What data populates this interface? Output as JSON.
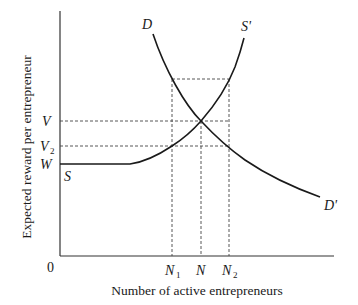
{
  "diagram": {
    "type": "supply-demand",
    "axes": {
      "x_label": "Number of active entrepreneurs",
      "y_label": "Expected reward per entrepreneur",
      "origin_label": "0"
    },
    "y_ticks": [
      {
        "label": "V",
        "sub": "",
        "level": "equilibrium reward"
      },
      {
        "label": "V",
        "sub": "2",
        "level": "reward at N1 / N2"
      },
      {
        "label": "W",
        "sub": "",
        "level": "wage floor"
      }
    ],
    "x_ticks": [
      {
        "label": "N",
        "sub": "1"
      },
      {
        "label": "N",
        "sub": ""
      },
      {
        "label": "N",
        "sub": "2"
      }
    ],
    "curves": [
      {
        "name": "demand",
        "start_label": "D",
        "end_label": "D'"
      },
      {
        "name": "supply",
        "start_label": "S",
        "end_label": "S'"
      }
    ],
    "colors": {
      "line": "#1a1a1a",
      "dashed": "#444444",
      "background": "#ffffff"
    }
  }
}
